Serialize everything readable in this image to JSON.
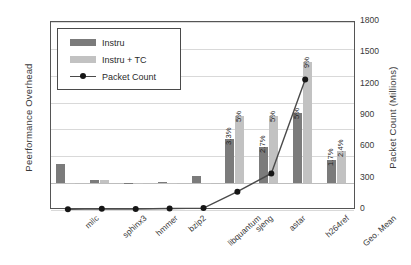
{
  "chart_data": {
    "type": "bar",
    "title": "",
    "xlabel": "",
    "ylabel": "Peerformance Overhead",
    "y2label": "Packet Count (Millions)",
    "categories": [
      "milc",
      "sphinx3",
      "hmmer",
      "bzip2",
      "libquantum",
      "sjeng",
      "astar",
      "h264ref",
      "Geo. Mean"
    ],
    "ylim": [
      -2,
      12
    ],
    "yticks": [
      "-2%",
      "0%",
      "2%",
      "4%",
      "6%",
      "8%",
      "10%",
      "12%"
    ],
    "ytick_values": [
      -2,
      0,
      2,
      4,
      6,
      8,
      10,
      12
    ],
    "y2lim": [
      0,
      1800
    ],
    "y2ticks": [
      "0",
      "300",
      "600",
      "900",
      "1200",
      "1500",
      "1800"
    ],
    "y2tick_values": [
      0,
      300,
      600,
      900,
      1200,
      1500,
      1800
    ],
    "grid": true,
    "legend_position": "upper-left",
    "series": [
      {
        "name": "Instru",
        "type": "bar",
        "axis": "left",
        "color": "#7b7b7b",
        "values": [
          1.4,
          0.25,
          0.02,
          0.05,
          0.55,
          3.3,
          2.7,
          5.2,
          1.7
        ],
        "labels": [
          "",
          "",
          "",
          "",
          "",
          "3.3%",
          "2.7%",
          "5%",
          "1.7%"
        ]
      },
      {
        "name": "Instru + TC",
        "type": "bar",
        "axis": "left",
        "color": "#c2c2c2",
        "values": [
          -0.08,
          0.22,
          0.0,
          0.03,
          -0.1,
          5.0,
          5.0,
          9.0,
          2.4
        ],
        "labels": [
          "",
          "",
          "",
          "",
          "",
          "5%",
          "5%",
          "9%",
          "2.4%"
        ]
      },
      {
        "name": "Packet Count",
        "type": "line",
        "axis": "right",
        "color": "#4a4a4a",
        "marker_color": "#161616",
        "values": [
          8,
          12,
          10,
          14,
          18,
          175,
          350,
          1250,
          null
        ]
      }
    ]
  },
  "legend": {
    "items": [
      {
        "label": "Instru",
        "icon": "bar-swatch-dark"
      },
      {
        "label": "Instru + TC",
        "icon": "bar-swatch-light"
      },
      {
        "label": "Packet Count",
        "icon": "line-marker"
      }
    ]
  }
}
